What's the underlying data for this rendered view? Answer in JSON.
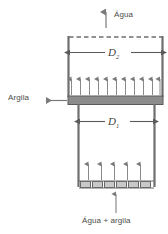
{
  "figure": {
    "type": "process-equipment-diagram"
  },
  "labels": {
    "top_outlet": "Água",
    "side_outlet": "Argila",
    "bottom_inlet": "Água + argila",
    "diameter_upper_letter": "D",
    "diameter_upper_sub": "2",
    "diameter_lower_letter": "D",
    "diameter_lower_sub": "1"
  },
  "geometry": {
    "upper_chamber": {
      "left": 68,
      "right": 163,
      "top": 37,
      "bottom": 97,
      "width": 95,
      "height": 60
    },
    "lower_chamber": {
      "left": 78,
      "right": 155,
      "top": 104,
      "bottom": 186,
      "width": 77,
      "height": 82
    },
    "clay_band": {
      "left": 68,
      "right": 163,
      "top": 96,
      "bottom": 104,
      "height": 8
    },
    "water_surface_dashed_y": 37,
    "distributor_plate": {
      "left": 80,
      "right": 153,
      "top": 181,
      "bottom": 188,
      "slots": 6
    }
  },
  "flow_arrows": {
    "upper_chamber_count": 11,
    "lower_chamber_count": 5,
    "top_outlet_count": 1,
    "bottom_inlet_count": 1,
    "side_outlet_count": 1
  },
  "dimension_lines": {
    "upper": {
      "y": 52,
      "x1": 69,
      "x2": 162,
      "label_key": "diameter_upper"
    },
    "lower": {
      "y": 121,
      "x1": 79,
      "x2": 154,
      "label_key": "diameter_lower"
    }
  },
  "colors": {
    "outline": "#6e6e6e",
    "clay_fill": "#8c8c8c",
    "clay_stroke": "#5a5a5a",
    "arrow": "#7a7a7a",
    "text": "#4a4a4a",
    "dim_text": "#3f3f3f",
    "background": "#ffffff",
    "plate_fill": "#c9c9c9",
    "plate_stroke": "#6b6b6b"
  }
}
